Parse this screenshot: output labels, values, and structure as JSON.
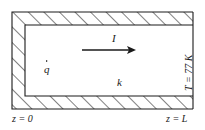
{
  "figure": {
    "colors": {
      "line": "#1a1a1a",
      "hatch": "#1a1a1a",
      "background": "#ffffff",
      "text": "#1a1a1a"
    },
    "labels": {
      "current": "I",
      "heat_generation": "q",
      "conductivity": "k",
      "z_origin": "z = 0",
      "z_end": "z = L",
      "temperature": "T = 77 K"
    },
    "geometry": {
      "outer": {
        "x": 12,
        "y": 12,
        "width": 181,
        "height": 97
      },
      "inner": {
        "x": 25,
        "y": 25,
        "width": 168,
        "height": 71
      },
      "hatch_angle_deg": 45,
      "wall_thickness": 13,
      "open_side": "right"
    },
    "arrow": {
      "label": "I",
      "x_start": 82,
      "x_end": 136,
      "y": 50,
      "direction": "right"
    }
  }
}
